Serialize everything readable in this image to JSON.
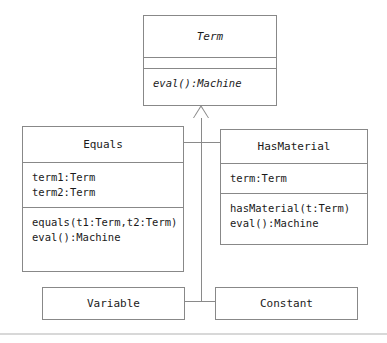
{
  "diagram": {
    "kind": "uml-class-diagram",
    "background_color": "#ffffff",
    "line_color": "#8a8a8a",
    "text_color": "#1a1a1a"
  },
  "classes": {
    "term": {
      "name": "Term",
      "is_abstract": true,
      "attributes": [],
      "operations": [
        "eval():Machine"
      ]
    },
    "equals": {
      "name": "Equals",
      "is_abstract": false,
      "attributes": [
        "term1:Term",
        "term2:Term"
      ],
      "operations": [
        "equals(t1:Term,t2:Term)",
        "eval():Machine"
      ]
    },
    "has_material": {
      "name": "HasMaterial",
      "is_abstract": false,
      "attributes": [
        "term:Term"
      ],
      "operations": [
        "hasMaterial(t:Term)",
        "eval():Machine"
      ]
    },
    "variable": {
      "name": "Variable",
      "is_abstract": false,
      "attributes": [],
      "operations": []
    },
    "constant": {
      "name": "Constant",
      "is_abstract": false,
      "attributes": [],
      "operations": []
    }
  },
  "relationships": [
    {
      "type": "generalization",
      "from": "Equals",
      "to": "Term"
    },
    {
      "type": "generalization",
      "from": "HasMaterial",
      "to": "Term"
    },
    {
      "type": "generalization",
      "from": "Variable",
      "to": "Term"
    },
    {
      "type": "generalization",
      "from": "Constant",
      "to": "Term"
    }
  ]
}
